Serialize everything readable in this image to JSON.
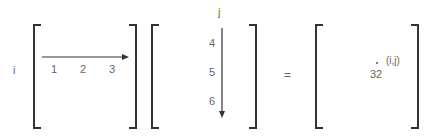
{
  "row_label": "i",
  "col_label": "j",
  "matrix_a": {
    "row_values": [
      "1",
      "2",
      "3"
    ]
  },
  "matrix_b": {
    "col_values": [
      "4",
      "5",
      "6"
    ]
  },
  "equals": "=",
  "result": {
    "value": "32",
    "position_label": "(i,j)"
  },
  "colors": {
    "bracket": "#333333",
    "arrow": "#333333",
    "text": "#666666"
  }
}
